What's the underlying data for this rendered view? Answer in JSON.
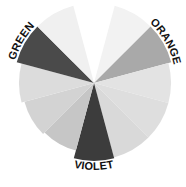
{
  "chart_data": {
    "type": "polar-area",
    "title": "",
    "center": [
      94,
      83
    ],
    "start_angle_deg": 15,
    "sector_width_deg": 30,
    "categories": [
      "",
      "ORANGE",
      "",
      "",
      "",
      "VIOLET",
      "",
      "",
      "",
      "GREEN",
      "",
      ""
    ],
    "values": [
      80,
      80,
      77,
      77,
      77,
      78,
      70,
      72,
      75,
      80,
      80,
      0
    ],
    "colors": [
      "#f2f2f2",
      "#a9a9a9",
      "#e3e3e3",
      "#dedede",
      "#d9d9d9",
      "#3c3c3c",
      "#c6c6c6",
      "#d3d3d3",
      "#dcdcdc",
      "#4a4a4a",
      "#f0f0f0",
      "#ffffff"
    ],
    "labels": [
      {
        "text": "ORANGE",
        "sector": 1
      },
      {
        "text": "VIOLET",
        "sector": 5
      },
      {
        "text": "GREEN",
        "sector": 9
      }
    ],
    "grid": false,
    "legend": "none"
  }
}
